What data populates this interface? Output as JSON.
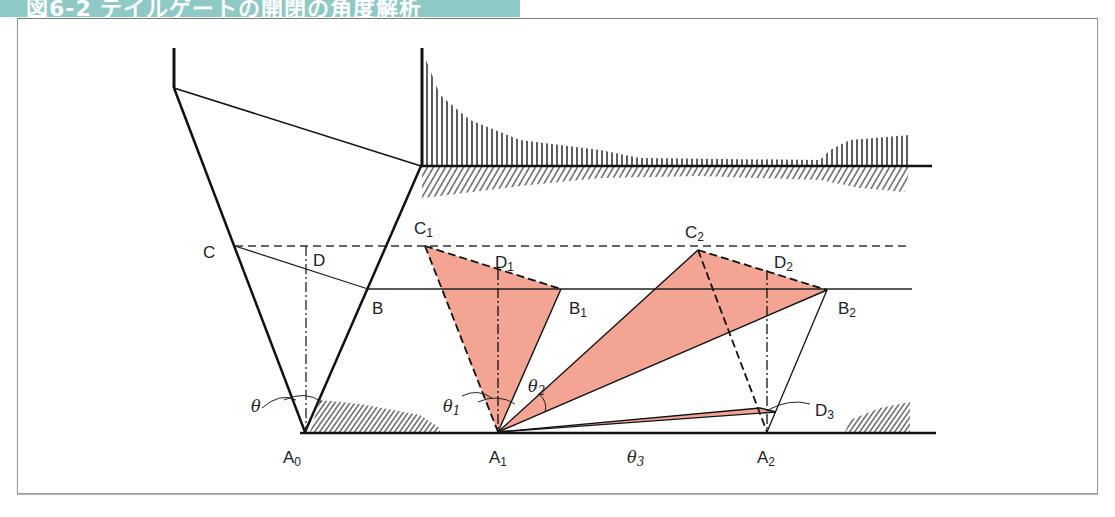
{
  "header": {
    "title": "図6-2 テイルゲートの開閉の角度解析",
    "color": "#8ec9c5"
  },
  "diagram": {
    "fill_color": "#f4a493",
    "line_color": "#1a1a1a",
    "labels": {
      "C": "C",
      "D": "D",
      "B": "B",
      "C1": "C",
      "C1_sub": "1",
      "D1": "D",
      "D1_sub": "1",
      "B1": "B",
      "B1_sub": "1",
      "C2": "C",
      "C2_sub": "2",
      "D2": "D",
      "D2_sub": "2",
      "B2": "B",
      "B2_sub": "2",
      "D3": "D",
      "D3_sub": "3",
      "A0": "A",
      "A0_sub": "0",
      "A1": "A",
      "A1_sub": "1",
      "A2": "A",
      "A2_sub": "2",
      "theta": "θ",
      "theta1": "θ",
      "theta1_sub": "1",
      "theta2": "θ",
      "theta2_sub": "2",
      "theta3": "θ",
      "theta3_sub": "3"
    }
  }
}
